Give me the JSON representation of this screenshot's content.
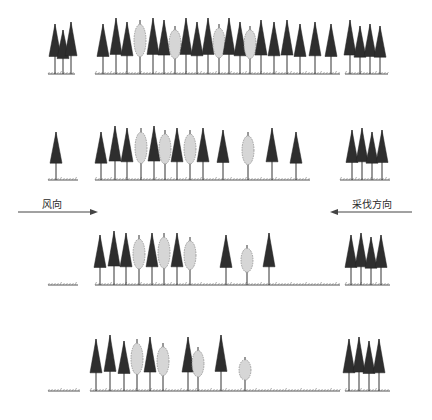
{
  "labels": {
    "wind_direction": "风向",
    "cutting_direction": "采伐方向"
  },
  "caption": "",
  "colors": {
    "conifer": "#2e2e2e",
    "broadleaf": "#8c8c8c",
    "ground": "#555555",
    "arrow": "#444444"
  },
  "rows": [
    {
      "name": "stage-1",
      "trees": [
        {
          "x": 55,
          "h": 50,
          "t": "c"
        },
        {
          "x": 63,
          "h": 44,
          "t": "c"
        },
        {
          "x": 71,
          "h": 52,
          "t": "c"
        },
        {
          "x": 103,
          "h": 50,
          "t": "c"
        },
        {
          "x": 116,
          "h": 56,
          "t": "c"
        },
        {
          "x": 127,
          "h": 52,
          "t": "c"
        },
        {
          "x": 140,
          "h": 54,
          "t": "b"
        },
        {
          "x": 153,
          "h": 56,
          "t": "c"
        },
        {
          "x": 164,
          "h": 54,
          "t": "c"
        },
        {
          "x": 175,
          "h": 48,
          "t": "b"
        },
        {
          "x": 186,
          "h": 56,
          "t": "c"
        },
        {
          "x": 197,
          "h": 52,
          "t": "c"
        },
        {
          "x": 208,
          "h": 56,
          "t": "c"
        },
        {
          "x": 219,
          "h": 50,
          "t": "b"
        },
        {
          "x": 229,
          "h": 56,
          "t": "c"
        },
        {
          "x": 240,
          "h": 52,
          "t": "c"
        },
        {
          "x": 250,
          "h": 48,
          "t": "b"
        },
        {
          "x": 261,
          "h": 54,
          "t": "c"
        },
        {
          "x": 274,
          "h": 52,
          "t": "c"
        },
        {
          "x": 287,
          "h": 54,
          "t": "c"
        },
        {
          "x": 300,
          "h": 50,
          "t": "c"
        },
        {
          "x": 315,
          "h": 52,
          "t": "c"
        },
        {
          "x": 331,
          "h": 50,
          "t": "c"
        },
        {
          "x": 350,
          "h": 54,
          "t": "c"
        },
        {
          "x": 360,
          "h": 48,
          "t": "c"
        },
        {
          "x": 370,
          "h": 50,
          "t": "c"
        },
        {
          "x": 380,
          "h": 48,
          "t": "c"
        }
      ]
    },
    {
      "name": "stage-2",
      "trees": [
        {
          "x": 56,
          "h": 48,
          "t": "c"
        },
        {
          "x": 101,
          "h": 48,
          "t": "c"
        },
        {
          "x": 115,
          "h": 54,
          "t": "c"
        },
        {
          "x": 127,
          "h": 52,
          "t": "c"
        },
        {
          "x": 141,
          "h": 52,
          "t": "b"
        },
        {
          "x": 154,
          "h": 54,
          "t": "c"
        },
        {
          "x": 165,
          "h": 50,
          "t": "b"
        },
        {
          "x": 177,
          "h": 52,
          "t": "c"
        },
        {
          "x": 190,
          "h": 50,
          "t": "b"
        },
        {
          "x": 203,
          "h": 52,
          "t": "c"
        },
        {
          "x": 223,
          "h": 50,
          "t": "c"
        },
        {
          "x": 248,
          "h": 48,
          "t": "b"
        },
        {
          "x": 272,
          "h": 52,
          "t": "c"
        },
        {
          "x": 296,
          "h": 48,
          "t": "c"
        },
        {
          "x": 352,
          "h": 50,
          "t": "c"
        },
        {
          "x": 362,
          "h": 52,
          "t": "c"
        },
        {
          "x": 372,
          "h": 48,
          "t": "c"
        },
        {
          "x": 382,
          "h": 50,
          "t": "c"
        }
      ]
    },
    {
      "name": "stage-3",
      "trees": [
        {
          "x": 100,
          "h": 50,
          "t": "c"
        },
        {
          "x": 114,
          "h": 54,
          "t": "c"
        },
        {
          "x": 126,
          "h": 52,
          "t": "c"
        },
        {
          "x": 139,
          "h": 50,
          "t": "b"
        },
        {
          "x": 152,
          "h": 52,
          "t": "c"
        },
        {
          "x": 164,
          "h": 52,
          "t": "b"
        },
        {
          "x": 177,
          "h": 52,
          "t": "c"
        },
        {
          "x": 190,
          "h": 48,
          "t": "b"
        },
        {
          "x": 226,
          "h": 50,
          "t": "c"
        },
        {
          "x": 247,
          "h": 40,
          "t": "b"
        },
        {
          "x": 269,
          "h": 52,
          "t": "c"
        },
        {
          "x": 351,
          "h": 50,
          "t": "c"
        },
        {
          "x": 361,
          "h": 52,
          "t": "c"
        },
        {
          "x": 371,
          "h": 48,
          "t": "c"
        },
        {
          "x": 381,
          "h": 50,
          "t": "c"
        }
      ]
    },
    {
      "name": "stage-4",
      "trees": [
        {
          "x": 96,
          "h": 52,
          "t": "c"
        },
        {
          "x": 110,
          "h": 56,
          "t": "c"
        },
        {
          "x": 124,
          "h": 50,
          "t": "c"
        },
        {
          "x": 137,
          "h": 52,
          "t": "b"
        },
        {
          "x": 150,
          "h": 54,
          "t": "c"
        },
        {
          "x": 163,
          "h": 48,
          "t": "b"
        },
        {
          "x": 188,
          "h": 54,
          "t": "c"
        },
        {
          "x": 198,
          "h": 44,
          "t": "b"
        },
        {
          "x": 221,
          "h": 56,
          "t": "c"
        },
        {
          "x": 245,
          "h": 34,
          "t": "b"
        },
        {
          "x": 349,
          "h": 52,
          "t": "c"
        },
        {
          "x": 359,
          "h": 54,
          "t": "c"
        },
        {
          "x": 369,
          "h": 50,
          "t": "c"
        },
        {
          "x": 379,
          "h": 52,
          "t": "c"
        }
      ]
    }
  ]
}
